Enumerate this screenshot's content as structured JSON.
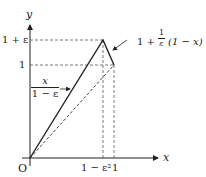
{
  "axes": {
    "x_label": "x",
    "y_label": "y",
    "origin_label": "O"
  },
  "y_ticks": {
    "top": "1 + ε",
    "mid": "1"
  },
  "x_ticks": {
    "left": "1 − ε²",
    "right": "1"
  },
  "annotations": {
    "left_line": {
      "numerator": "x",
      "denominator": "1 − ε"
    },
    "right_line": {
      "prefix": "1 +",
      "frac_num": "1",
      "frac_den": "ε",
      "suffix": "(1 − x)"
    }
  },
  "colors": {
    "ink": "#222222",
    "dash": "#555555"
  }
}
